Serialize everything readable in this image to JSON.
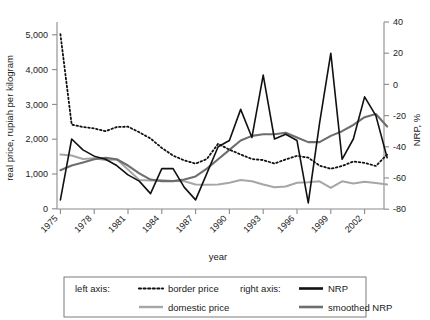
{
  "chart_data": {
    "type": "line",
    "title": "",
    "xlabel": "year",
    "ylabel": "real price, rupiah per kilogram",
    "y2label": "NRP, %",
    "grid": false,
    "legend_position": "bottom",
    "xlim": [
      1975,
      2004
    ],
    "ylim": [
      0,
      5500
    ],
    "y2lim": [
      -80,
      40
    ],
    "y_ticks": [
      "0",
      "1,000",
      "2,000",
      "3,000",
      "4,000",
      "5,000"
    ],
    "y_tick_values": [
      0,
      1000,
      2000,
      3000,
      4000,
      5000
    ],
    "y2_ticks": [
      "-80",
      "-60",
      "-40",
      "-20",
      "0",
      "20",
      "40"
    ],
    "y2_tick_values": [
      -80,
      -60,
      -40,
      -20,
      0,
      20,
      40
    ],
    "x_ticks": [
      "1975",
      "1978",
      "1981",
      "1984",
      "1987",
      "1990",
      "1993",
      "1996",
      "1999",
      "2002"
    ],
    "x_tick_values": [
      1975,
      1978,
      1981,
      1984,
      1987,
      1990,
      1993,
      1996,
      1999,
      2002
    ],
    "x": [
      1975,
      1976,
      1977,
      1978,
      1979,
      1980,
      1981,
      1982,
      1983,
      1984,
      1985,
      1986,
      1987,
      1988,
      1989,
      1990,
      1991,
      1992,
      1993,
      1994,
      1995,
      1996,
      1997,
      1998,
      1999,
      2000,
      2001,
      2002,
      2003,
      2004
    ],
    "series": [
      {
        "name": "border price",
        "axis": "left",
        "style": "dotted",
        "color": "#111111",
        "values": [
          5020,
          2420,
          2350,
          2310,
          2230,
          2350,
          2360,
          2200,
          2020,
          1750,
          1530,
          1390,
          1300,
          1430,
          1870,
          1700,
          1560,
          1430,
          1400,
          1300,
          1420,
          1520,
          1470,
          1240,
          1150,
          1230,
          1360,
          1320,
          1230,
          1560
        ]
      },
      {
        "name": "domestic price",
        "axis": "left",
        "style": "solid",
        "color": "#a6a6a6",
        "values": [
          1560,
          1530,
          1430,
          1450,
          1400,
          1420,
          1130,
          830,
          810,
          820,
          800,
          790,
          700,
          690,
          700,
          750,
          830,
          790,
          700,
          620,
          640,
          750,
          760,
          790,
          600,
          790,
          730,
          780,
          740,
          700
        ]
      },
      {
        "name": "NRP",
        "axis": "right",
        "style": "solid",
        "color": "#111111",
        "values": [
          -74,
          -35,
          -42,
          -46,
          -48,
          -52,
          -58,
          -62,
          -70,
          -54,
          -54,
          -66,
          -74,
          -57,
          -40,
          -36,
          -16,
          -34,
          6,
          -35,
          -32,
          -36,
          -76,
          -25,
          20,
          -48,
          -35,
          -8,
          -20,
          -47
        ]
      },
      {
        "name": "smoothed NRP",
        "axis": "right",
        "style": "solid",
        "color": "#6e6e6e",
        "values": [
          -55,
          -52,
          -50,
          -48,
          -47,
          -48,
          -52,
          -57,
          -61,
          -62,
          -62,
          -61,
          -59,
          -54,
          -48,
          -42,
          -36,
          -33,
          -32,
          -32,
          -31,
          -34,
          -37,
          -37,
          -33,
          -30,
          -26,
          -21,
          -19,
          -27
        ]
      }
    ]
  },
  "legend": {
    "left_axis_label": "left axis:",
    "right_axis_label": "right axis:",
    "entries": [
      {
        "label": "border price"
      },
      {
        "label": "domestic price"
      },
      {
        "label": "NRP"
      },
      {
        "label": "smoothed NRP"
      }
    ]
  }
}
